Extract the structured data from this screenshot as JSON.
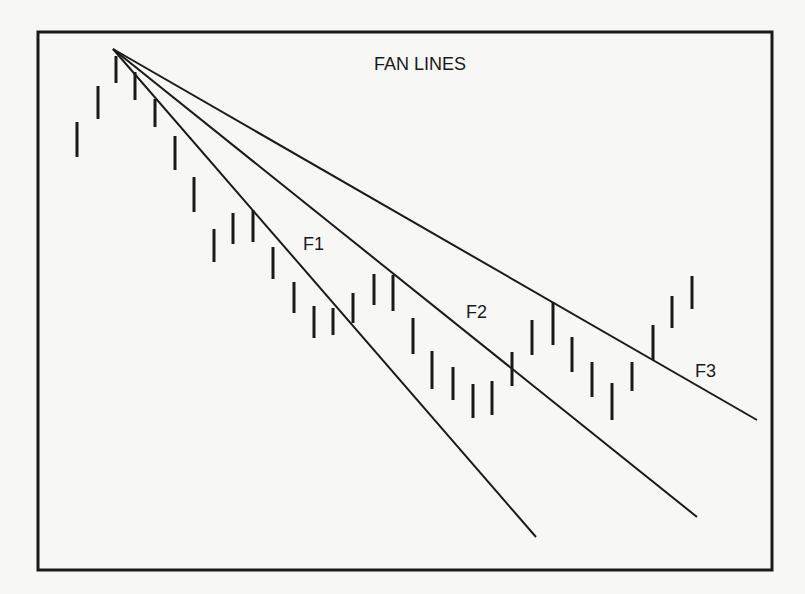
{
  "chart_data": {
    "type": "diagram-bar",
    "title": "FAN LINES",
    "xlabel": "",
    "ylabel": "",
    "grid": false,
    "frame": {
      "x1": 38,
      "y1": 32,
      "x2": 772,
      "y2": 570
    },
    "colors": {
      "ink": "#1a1a1a",
      "paper": "#f7f7f5"
    },
    "fan_origin": {
      "x": 113,
      "y": 49
    },
    "fan_lines": [
      {
        "name": "F1",
        "end": {
          "x": 536,
          "y": 537
        },
        "label_pos": {
          "x": 303,
          "y": 250
        }
      },
      {
        "name": "F2",
        "end": {
          "x": 697,
          "y": 517
        },
        "label_pos": {
          "x": 466,
          "y": 318
        }
      },
      {
        "name": "F3",
        "end": {
          "x": 757,
          "y": 420
        },
        "label_pos": {
          "x": 695,
          "y": 377
        }
      }
    ],
    "bars": [
      {
        "x": 77,
        "high": 122,
        "low": 157
      },
      {
        "x": 98,
        "high": 86,
        "low": 119
      },
      {
        "x": 116,
        "high": 56,
        "low": 83
      },
      {
        "x": 135,
        "high": 72,
        "low": 100
      },
      {
        "x": 155,
        "high": 99,
        "low": 127
      },
      {
        "x": 175,
        "high": 136,
        "low": 170
      },
      {
        "x": 194,
        "high": 177,
        "low": 212
      },
      {
        "x": 214,
        "high": 229,
        "low": 262
      },
      {
        "x": 233,
        "high": 213,
        "low": 244
      },
      {
        "x": 253,
        "high": 210,
        "low": 242
      },
      {
        "x": 273,
        "high": 247,
        "low": 279
      },
      {
        "x": 294,
        "high": 282,
        "low": 313
      },
      {
        "x": 314,
        "high": 306,
        "low": 338
      },
      {
        "x": 333,
        "high": 308,
        "low": 335
      },
      {
        "x": 353,
        "high": 293,
        "low": 323
      },
      {
        "x": 374,
        "high": 274,
        "low": 305
      },
      {
        "x": 393,
        "high": 275,
        "low": 311
      },
      {
        "x": 413,
        "high": 318,
        "low": 354
      },
      {
        "x": 432,
        "high": 351,
        "low": 389
      },
      {
        "x": 453,
        "high": 367,
        "low": 400
      },
      {
        "x": 473,
        "high": 384,
        "low": 418
      },
      {
        "x": 492,
        "high": 381,
        "low": 415
      },
      {
        "x": 512,
        "high": 352,
        "low": 386
      },
      {
        "x": 532,
        "high": 320,
        "low": 355
      },
      {
        "x": 553,
        "high": 302,
        "low": 345
      },
      {
        "x": 572,
        "high": 337,
        "low": 372
      },
      {
        "x": 592,
        "high": 362,
        "low": 397
      },
      {
        "x": 612,
        "high": 383,
        "low": 420
      },
      {
        "x": 632,
        "high": 362,
        "low": 391
      },
      {
        "x": 653,
        "high": 325,
        "low": 360
      },
      {
        "x": 672,
        "high": 296,
        "low": 328
      },
      {
        "x": 692,
        "high": 276,
        "low": 309
      }
    ],
    "note": "Coordinates are in screen pixels; a smaller y means a higher price. Each bar runs from its high to its low."
  },
  "labels": {
    "title": "FAN LINES",
    "f1": "F1",
    "f2": "F2",
    "f3": "F3"
  }
}
